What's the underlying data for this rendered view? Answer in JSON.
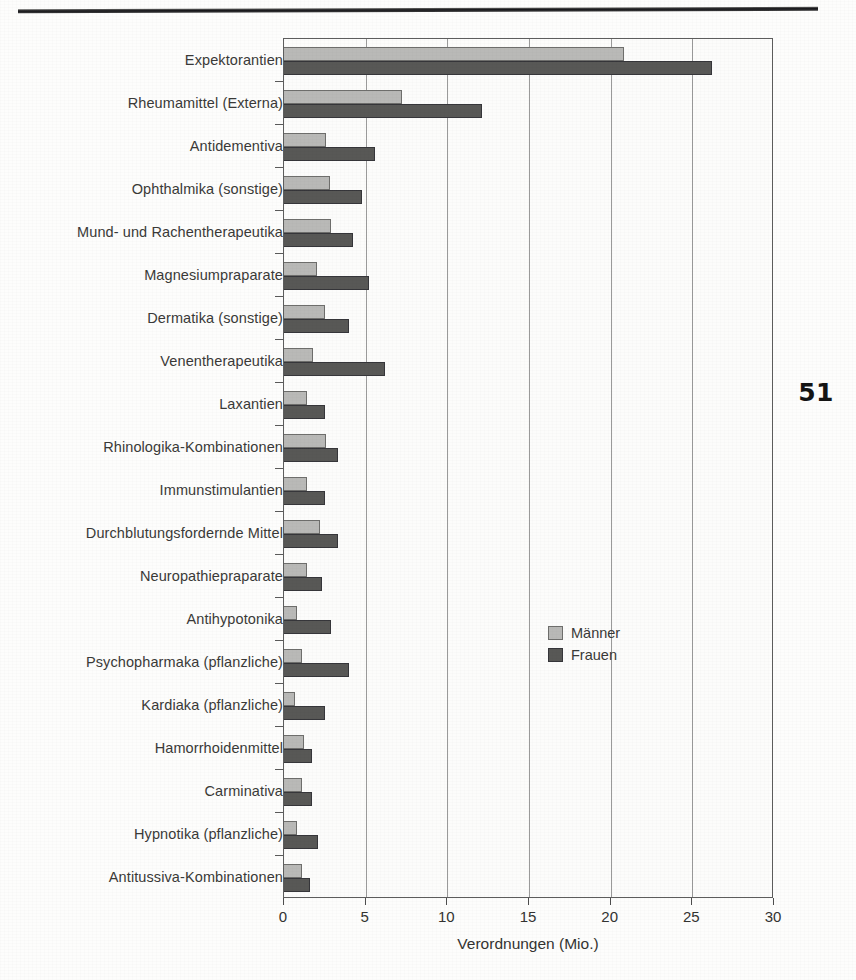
{
  "page": {
    "number": "51"
  },
  "chart_data": {
    "type": "bar",
    "orientation": "horizontal",
    "title": "",
    "xlabel": "Verordnungen (Mio.)",
    "ylabel": "",
    "xlim": [
      0,
      30
    ],
    "xticks": [
      "0",
      "5",
      "10",
      "15",
      "20",
      "25",
      "30"
    ],
    "grid": true,
    "legend_position": "center-right",
    "categories": [
      "Expektorantien",
      "Rheumamittel (Externa)",
      "Antidementiva",
      "Ophthalmika (sonstige)",
      "Mund- und Rachentherapeutika",
      "Magnesiumpraparate",
      "Dermatika (sonstige)",
      "Venentherapeutika",
      "Laxantien",
      "Rhinologika-Kombinationen",
      "Immunstimulantien",
      "Durchblutungsfordernde Mittel",
      "Neuropathiepraparate",
      "Antihypotonika",
      "Psychopharmaka (pflanzliche)",
      "Kardiaka (pflanzliche)",
      "Hamorrhoidenmittel",
      "Carminativa",
      "Hypnotika (pflanzliche)",
      "Antitussiva-Kombinationen"
    ],
    "series": [
      {
        "name": "Männer",
        "color": "#b9b9b7",
        "values": [
          20.8,
          7.2,
          2.6,
          2.8,
          2.9,
          2.0,
          2.5,
          1.8,
          1.4,
          2.6,
          1.4,
          2.2,
          1.4,
          0.8,
          1.1,
          0.7,
          1.2,
          1.1,
          0.8,
          1.1
        ]
      },
      {
        "name": "Frauen",
        "color": "#585856",
        "values": [
          26.2,
          12.1,
          5.6,
          4.8,
          4.2,
          5.2,
          4.0,
          6.2,
          2.5,
          3.3,
          2.5,
          3.3,
          2.3,
          2.9,
          4.0,
          2.5,
          1.7,
          1.7,
          2.1,
          1.6
        ]
      }
    ]
  },
  "legend": {
    "items": [
      {
        "label": "Männer",
        "color": "#b9b9b7"
      },
      {
        "label": "Frauen",
        "color": "#585856"
      }
    ]
  }
}
